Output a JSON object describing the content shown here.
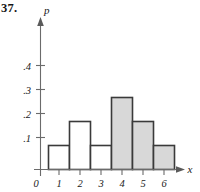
{
  "figure": {
    "problem_number": "37.",
    "axis_labels": {
      "vertical": "p",
      "horizontal": "x"
    },
    "origin_label": "0"
  },
  "chart_data": {
    "type": "bar",
    "title": "",
    "xlabel": "x",
    "ylabel": "p",
    "categories": [
      "1",
      "2",
      "3",
      "4",
      "5",
      "6"
    ],
    "values": [
      0.1,
      0.2,
      0.1,
      0.3,
      0.2,
      0.1
    ],
    "bar_fills": [
      "white",
      "white",
      "white",
      "shaded",
      "shaded",
      "shaded"
    ],
    "xlim": [
      0.5,
      6.5
    ],
    "ylim": [
      0,
      0.45
    ],
    "x_tick_labels": [
      "1",
      "2",
      "3",
      "4",
      "5",
      "6"
    ],
    "x_tick_values": [
      1,
      2,
      3,
      4,
      5,
      6
    ],
    "y_tick_labels": [
      ".1",
      ".2",
      ".3",
      ".4"
    ],
    "y_tick_values": [
      0.1,
      0.2,
      0.3,
      0.4
    ],
    "grid": false,
    "legend": "none",
    "bar_width": 1
  },
  "colors": {
    "shaded_bar_fill": "#d8d8d8",
    "unshaded_bar_fill": "#ffffff",
    "bar_outline": "#3a3a3a",
    "axis": "#6b6b6b",
    "text": "#1a1a1a"
  }
}
